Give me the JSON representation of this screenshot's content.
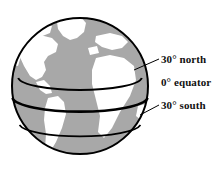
{
  "figure": {
    "kind": "globe-diagram",
    "background_color": "#ffffff"
  },
  "globe": {
    "ocean_color": "#a8a8a8",
    "land_color": "#ffffff",
    "outline_color": "#000000",
    "center_x": 80,
    "center_y": 86,
    "radius": 68
  },
  "latitude_lines": [
    {
      "id": "north30",
      "label": "30° north",
      "degrees": 30,
      "hemisphere": "north",
      "y": 78,
      "color": "#000000"
    },
    {
      "id": "equator",
      "label": "0° equator",
      "degrees": 0,
      "hemisphere": "equator",
      "y": 98,
      "color": "#000000"
    },
    {
      "id": "south30",
      "label": "30° south",
      "degrees": -30,
      "hemisphere": "south",
      "y": 125,
      "color": "#000000"
    }
  ],
  "labels": {
    "north": "30° north",
    "equator": "0° equator",
    "south": "30° south"
  },
  "continents": [
    "North America",
    "Greenland",
    "Europe",
    "Africa",
    "South America"
  ]
}
